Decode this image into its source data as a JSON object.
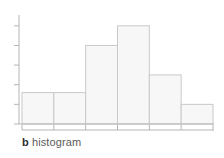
{
  "figure": {
    "caption_letter": "b",
    "caption_text": "histogram"
  },
  "colors": {
    "bar_fill": "#f7f7f7",
    "bar_edge": "#c9c9c9",
    "axis": "#b5b5b5",
    "tick": "#b5b5b5",
    "caption_letter": "#2e2e2e",
    "caption_text": "#5a5a5a",
    "background": "#ffffff"
  },
  "chart_data": {
    "type": "bar",
    "title": "",
    "subtitle": "",
    "xlabel": "",
    "ylabel": "",
    "categories": [
      "1",
      "2",
      "3",
      "4",
      "5",
      "6"
    ],
    "values": [
      1.6,
      1.6,
      4.0,
      5.0,
      2.5,
      1.0
    ],
    "bin_edges": [
      0,
      1,
      2,
      3,
      4,
      5,
      6
    ],
    "ylim": [
      0,
      5.5
    ],
    "xlim": [
      0,
      6
    ],
    "yticks": [
      0,
      1,
      2,
      3,
      4,
      5
    ],
    "xticks": [
      0,
      1,
      2,
      3,
      4,
      5,
      6
    ],
    "tick_labels_x": [
      "",
      "",
      "",
      "",
      "",
      "",
      ""
    ],
    "tick_labels_y": [
      "",
      "",
      "",
      "",
      "",
      ""
    ],
    "grid": false,
    "legend": false,
    "legend_position": "none",
    "annotations": []
  }
}
